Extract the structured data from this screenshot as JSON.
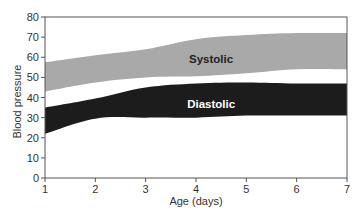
{
  "chart_data": {
    "type": "area",
    "title": "",
    "xlabel": "Age (days)",
    "ylabel": "Blood pressure",
    "xlim": [
      1,
      7
    ],
    "ylim": [
      0,
      80
    ],
    "x_ticks": [
      1,
      2,
      3,
      4,
      5,
      6,
      7
    ],
    "y_ticks": [
      0,
      10,
      20,
      30,
      40,
      50,
      60,
      70,
      80
    ],
    "grid": false,
    "legend": "none (labels drawn inside bands)",
    "x": [
      1,
      2,
      3,
      4,
      5,
      6,
      7
    ],
    "series": [
      {
        "name": "Systolic",
        "kind": "range-band",
        "color": "#a9a9a9",
        "label_color": "#222222",
        "upper": [
          57.5,
          61,
          64,
          69,
          71,
          72,
          72
        ],
        "lower": [
          43,
          47.5,
          50,
          50.5,
          52,
          54,
          54
        ]
      },
      {
        "name": "Diastolic",
        "kind": "range-band",
        "color": "#1c1c1c",
        "label_color": "#ffffff",
        "upper": [
          35,
          39.5,
          45,
          47,
          47.5,
          47,
          47
        ],
        "lower": [
          22,
          29.5,
          30,
          30,
          31,
          31,
          31
        ]
      }
    ],
    "annotations": [
      {
        "text": "Systolic",
        "x": 4.3,
        "y": 59
      },
      {
        "text": "Diastolic",
        "x": 4.3,
        "y": 37
      }
    ]
  }
}
